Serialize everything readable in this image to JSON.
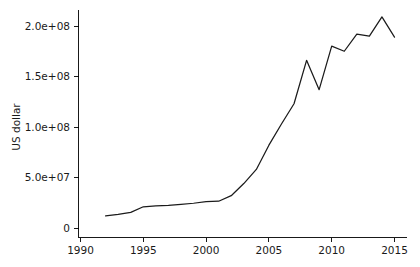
{
  "chart_data": {
    "type": "line",
    "title": "",
    "subtitle": "",
    "xlabel": "",
    "ylabel": "US dollar",
    "xlim": [
      1990,
      2016
    ],
    "ylim": [
      0,
      215000000
    ],
    "grid": false,
    "legend": null,
    "x_ticks": [
      1990,
      1995,
      2000,
      2005,
      2010,
      2015
    ],
    "x_tick_labels": [
      "1990",
      "1995",
      "2000",
      "2005",
      "2010",
      "2015"
    ],
    "y_ticks": [
      0,
      50000000,
      100000000,
      150000000,
      200000000
    ],
    "y_tick_labels": [
      "0",
      "5.0e+07",
      "1.0e+08",
      "1.5e+08",
      "2.0e+08"
    ],
    "x": [
      1992,
      1993,
      1994,
      1995,
      1996,
      1997,
      1998,
      1999,
      2000,
      2001,
      2002,
      2003,
      2004,
      2005,
      2006,
      2007,
      2008,
      2009,
      2010,
      2011,
      2012,
      2013,
      2014,
      2015
    ],
    "values": [
      12000000,
      13500000,
      15500000,
      21000000,
      22000000,
      22500000,
      23500000,
      24500000,
      26000000,
      26500000,
      32000000,
      44000000,
      58000000,
      82000000,
      103000000,
      123000000,
      166000000,
      137000000,
      180000000,
      175000000,
      192000000,
      190000000,
      209000000,
      189000000
    ],
    "series_name": "US dollar",
    "line_color": "#1b1b1b"
  },
  "axes": {
    "y_axis_title": "US dollar"
  }
}
